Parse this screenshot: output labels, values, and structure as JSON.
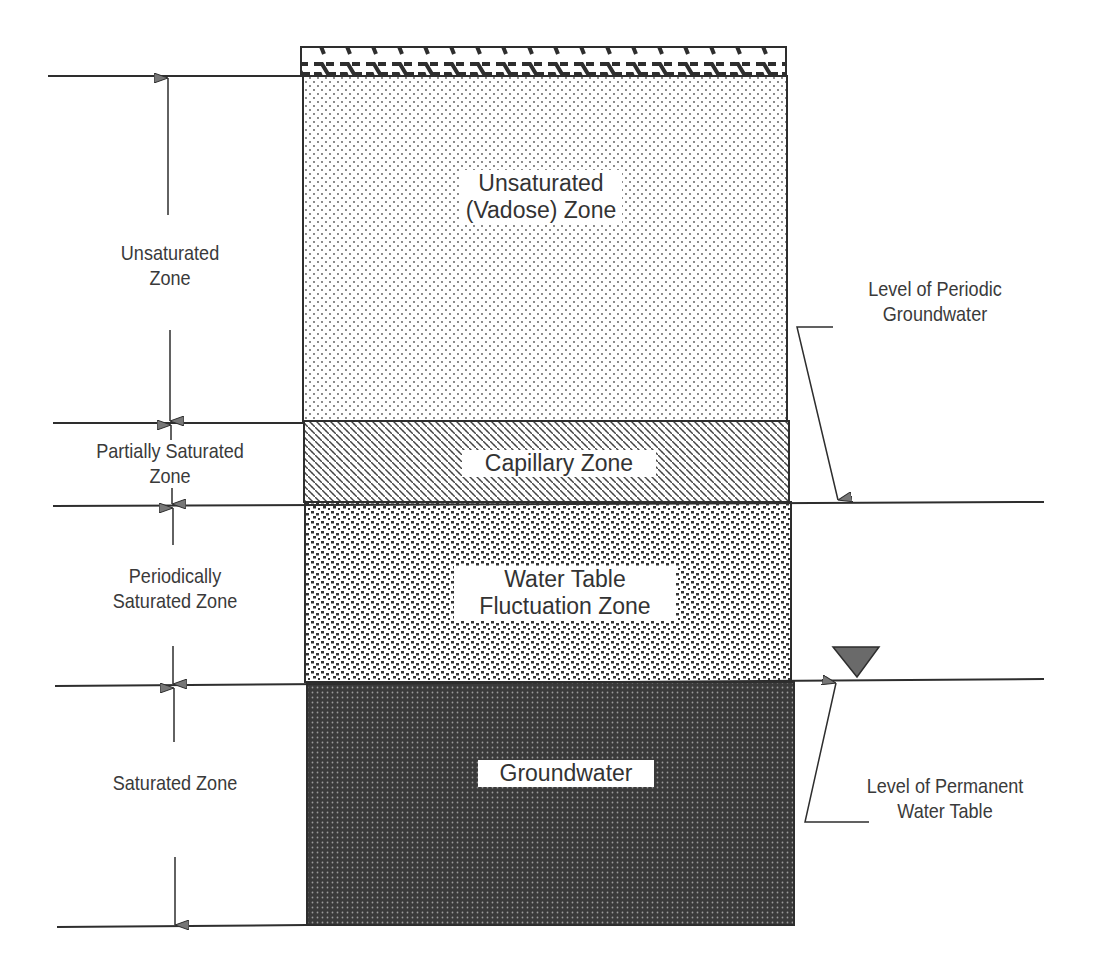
{
  "diagram": {
    "type": "soil-groundwater-zone-profile",
    "column": {
      "surface_cap": "ground-surface-hatch",
      "layers": [
        {
          "id": "vadose",
          "label_line1": "Unsaturated",
          "label_line2": "(Vadose) Zone",
          "pattern": "fine-dots"
        },
        {
          "id": "capillary",
          "label": "Capillary Zone",
          "pattern": "diagonal-dashes"
        },
        {
          "id": "fluctuation",
          "label_line1": "Water Table",
          "label_line2": "Fluctuation Zone",
          "pattern": "coarse-dashes"
        },
        {
          "id": "groundwater",
          "label": "Groundwater",
          "pattern": "dark-dense-dots"
        }
      ]
    },
    "left_labels": {
      "unsaturated": {
        "line1": "Unsaturated",
        "line2": "Zone"
      },
      "partially_saturated": {
        "line1": "Partially Saturated",
        "line2": "Zone"
      },
      "periodically_saturated": {
        "line1": "Periodically",
        "line2": "Saturated Zone"
      },
      "saturated": {
        "line1": "Saturated Zone"
      }
    },
    "right_labels": {
      "periodic": {
        "line1": "Level of Periodic",
        "line2": "Groundwater"
      },
      "permanent": {
        "line1": "Level of Permanent",
        "line2": "Water Table"
      }
    },
    "icons": {
      "water_table_symbol": "inverted-triangle"
    },
    "colors": {
      "ink": "#2e2e2e",
      "text": "#3a3a3a",
      "arrow_fill": "#777777",
      "groundwater_fill": "#3a3a3a",
      "background": "#ffffff"
    }
  }
}
